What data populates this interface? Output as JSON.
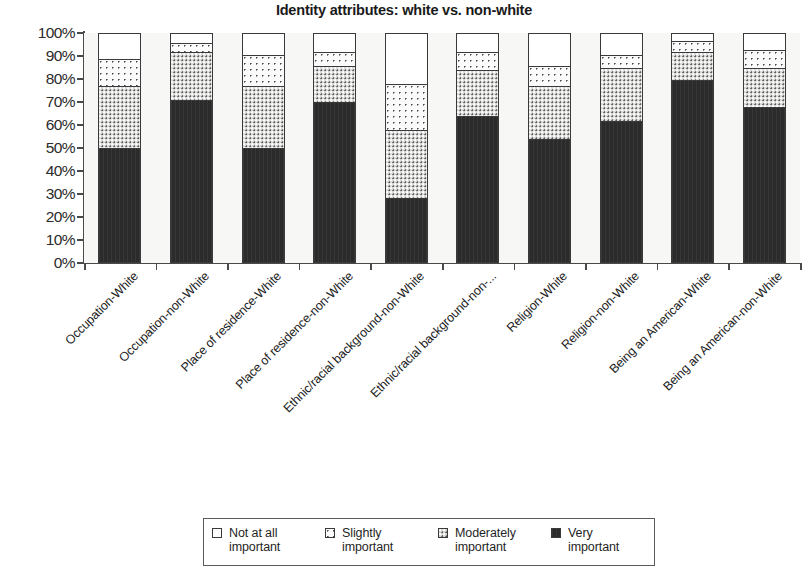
{
  "chart_data": {
    "type": "bar",
    "subtype": "stacked-percent-column",
    "title": "Identity attributes: white vs. non-white",
    "xlabel": "",
    "ylabel": "",
    "ylim": [
      0,
      100
    ],
    "ytick_labels": [
      "100%",
      "90%",
      "80%",
      "70%",
      "60%",
      "50%",
      "40%",
      "30%",
      "20%",
      "10%",
      "0%"
    ],
    "ytick_values": [
      100,
      90,
      80,
      70,
      60,
      50,
      40,
      30,
      20,
      10,
      0
    ],
    "grid": false,
    "legend_position": "bottom",
    "stack_order_bottom_to_top": [
      "Very important",
      "Moderately important",
      "Slightly important",
      "Not at all important"
    ],
    "categories": [
      "Occupation-White",
      "Occupation-non-White",
      "Place of residence-White",
      "Place of residence-non-White",
      "Ethnic/racial background-non-White",
      "Ethnic/racial background-non-...",
      "Religion-White",
      "Religion-non-White",
      "Being an American-White",
      "Being an American-non-White"
    ],
    "series": [
      {
        "name": "Very important",
        "pattern": "solid-black",
        "color": "#2b2b2b",
        "values": [
          50,
          71,
          50,
          70,
          28,
          64,
          54,
          62,
          80,
          68
        ]
      },
      {
        "name": "Moderately important",
        "pattern": "checkered-gray",
        "color": "#d6d6d4",
        "values": [
          27,
          21,
          27,
          16,
          30,
          20,
          23,
          23,
          12,
          17
        ]
      },
      {
        "name": "Slightly important",
        "pattern": "sparse-dots",
        "color": "#fbfbfb",
        "values": [
          12,
          4,
          14,
          6,
          20,
          8,
          9,
          6,
          5,
          8
        ]
      },
      {
        "name": "Not at all important",
        "pattern": "white",
        "color": "#ffffff",
        "values": [
          11,
          4,
          9,
          8,
          22,
          8,
          14,
          9,
          3,
          7
        ]
      }
    ]
  },
  "legend": {
    "items": [
      {
        "label_line1": "Not at all",
        "label_line2": "important",
        "swatch": "white-square"
      },
      {
        "label_line1": "Slightly",
        "label_line2": "important",
        "swatch": "dotted-square"
      },
      {
        "label_line1": "Moderately",
        "label_line2": "important",
        "swatch": "checkered-square"
      },
      {
        "label_line1": "Very",
        "label_line2": "important",
        "swatch": "black-square"
      }
    ]
  }
}
